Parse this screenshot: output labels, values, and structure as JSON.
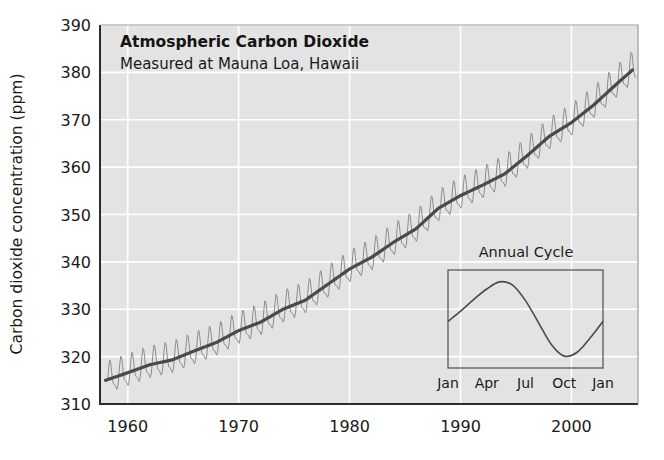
{
  "chart_data": {
    "type": "line",
    "title": "Atmospheric Carbon Dioxide",
    "subtitle": "Measured at Mauna Loa, Hawaii",
    "xlabel": "",
    "ylabel": "Carbon dioxide concentration (ppm)",
    "xlim": [
      1957.5,
      2006.0
    ],
    "ylim": [
      310,
      390
    ],
    "xticks": [
      1960,
      1970,
      1980,
      1990,
      2000
    ],
    "xtick_labels": [
      "1960",
      "1970",
      "1980",
      "1990",
      "2000"
    ],
    "yticks": [
      310,
      320,
      330,
      340,
      350,
      360,
      370,
      380,
      390
    ],
    "ytick_labels": [
      "310",
      "320",
      "330",
      "340",
      "350",
      "360",
      "370",
      "380",
      "390"
    ],
    "grid": true,
    "grid_color": "#ffffff",
    "plot_bgcolor": "#e3e3e3",
    "legend": "none",
    "series": [
      {
        "name": "Monthly mean CO2 (seasonal sawtooth)",
        "color": "#8c8c8c",
        "line_width": 1,
        "seasonal_amplitude_ppm": 6.0,
        "seasonal_peak_month": 5,
        "seasonal_min_month": 9.5
      },
      {
        "name": "Seasonally adjusted trend",
        "color": "#4a4a4a",
        "line_width": 3.2,
        "x": [
          1958,
          1960,
          1962,
          1964,
          1966,
          1968,
          1970,
          1972,
          1974,
          1976,
          1978,
          1980,
          1982,
          1984,
          1986,
          1988,
          1990,
          1992,
          1994,
          1996,
          1998,
          2000,
          2002,
          2004,
          2005.5
        ],
        "values": [
          315.0,
          316.6,
          318.3,
          319.3,
          321.2,
          323.0,
          325.5,
          327.3,
          330.0,
          331.9,
          335.2,
          338.5,
          341.0,
          344.2,
          347.0,
          351.3,
          354.0,
          356.2,
          358.6,
          362.4,
          366.5,
          369.4,
          373.1,
          377.4,
          380.5
        ]
      }
    ],
    "inset": {
      "title": "Annual Cycle",
      "type": "line",
      "color": "#4a4a4a",
      "line_width": 1.6,
      "xlabel": "",
      "ylabel": "",
      "xticks": [
        0,
        3,
        6,
        9,
        12
      ],
      "xtick_labels": [
        "Jan",
        "Apr",
        "Jul",
        "Oct",
        "Jan"
      ],
      "x": [
        0,
        1,
        2,
        3,
        4,
        5,
        6,
        7,
        8,
        9,
        10,
        11,
        12
      ],
      "values": [
        -0.2,
        0.6,
        1.5,
        2.3,
        2.85,
        2.6,
        1.4,
        -0.3,
        -2.0,
        -2.9,
        -2.6,
        -1.5,
        -0.2
      ],
      "grid": false,
      "frame": true
    }
  }
}
